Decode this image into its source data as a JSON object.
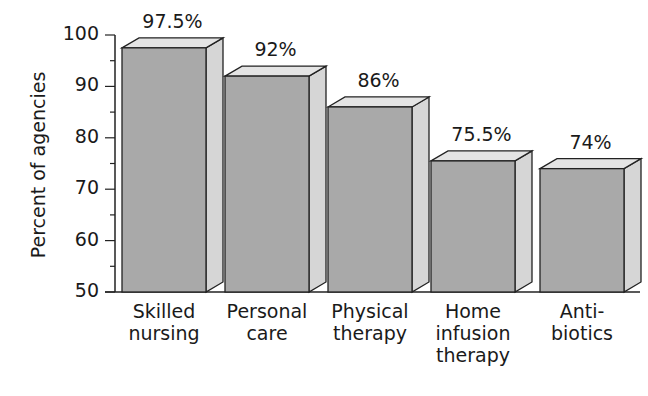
{
  "chart_data": {
    "type": "bar",
    "title": "",
    "xlabel": "",
    "ylabel": "Percent of agencies",
    "categories": [
      "Skilled\nnursing",
      "Personal\ncare",
      "Physical\ntherapy",
      "Home\ninfusion\ntherapy",
      "Anti-\nbiotics"
    ],
    "values": [
      97.5,
      92,
      86,
      75.5,
      74
    ],
    "value_labels": [
      "97.5%",
      "92%",
      "86%",
      "75.5%",
      "74%"
    ],
    "ylim": [
      50,
      100
    ],
    "yticks": [
      "50",
      "60",
      "70",
      "80",
      "90",
      "100"
    ],
    "grid": false,
    "legend": null,
    "style": "3d-bar"
  },
  "colors": {
    "front": "#a9a9a9",
    "side": "#d6d6d6",
    "top": "#e4e4e4",
    "outline": "#222222"
  }
}
